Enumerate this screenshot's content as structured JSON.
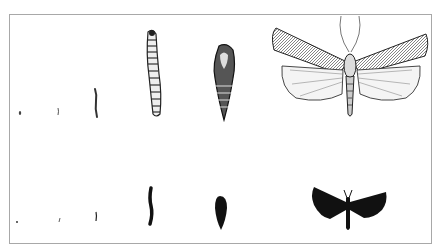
{
  "figure": {
    "stages": [
      {
        "name": "egg",
        "detailed": "egg-drawing",
        "silhouette": "egg-silhouette"
      },
      {
        "name": "larva-early",
        "detailed": "larva-early-drawing",
        "silhouette": "larva-early-silhouette"
      },
      {
        "name": "larva-mid",
        "detailed": "larva-mid-drawing",
        "silhouette": "larva-mid-silhouette"
      },
      {
        "name": "larva-mature",
        "detailed": "larva-mature-drawing",
        "silhouette": "larva-mature-silhouette"
      },
      {
        "name": "pupa",
        "detailed": "pupa-drawing",
        "silhouette": "pupa-silhouette"
      },
      {
        "name": "adult",
        "detailed": "adult-moth-drawing",
        "silhouette": "adult-moth-silhouette"
      }
    ],
    "colors": {
      "ink": "#1a1a1a",
      "frame": "#a8a8a8",
      "background": "#ffffff"
    }
  }
}
